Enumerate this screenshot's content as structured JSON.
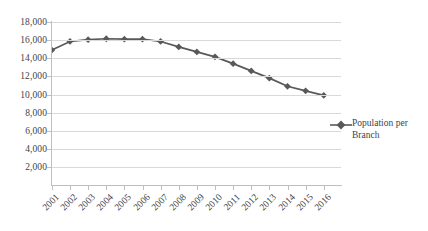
{
  "chart_data": {
    "type": "line",
    "title": "",
    "xlabel": "",
    "ylabel": "",
    "categories": [
      "2001",
      "2002",
      "2003",
      "2004",
      "2005",
      "2006",
      "2007",
      "2008",
      "2009",
      "2010",
      "2011",
      "2012",
      "2013",
      "2014",
      "2015",
      "2016"
    ],
    "series": [
      {
        "name": "Population per Branch",
        "color": "#595959",
        "marker": "diamond",
        "values": [
          14900,
          15850,
          16050,
          16150,
          16100,
          16100,
          15850,
          15250,
          14700,
          14150,
          13400,
          12600,
          11800,
          10900,
          10400,
          9900
        ]
      }
    ],
    "ylim": [
      0,
      18000
    ],
    "ytick_values": [
      2000,
      4000,
      6000,
      8000,
      10000,
      12000,
      14000,
      16000,
      18000
    ],
    "ytick_labels": [
      "2,000",
      "4,000",
      "6,000",
      "8,000",
      "10,000",
      "12,000",
      "14,000",
      "16,000",
      "18,000"
    ],
    "grid": true,
    "grid_axis": "y",
    "grid_color": "#d9d9d9",
    "axis_color": "#bfbfbf",
    "legend_position": "right",
    "legend_entries": [
      "Population per Branch"
    ]
  },
  "legend": {
    "entry_label": "Population per Branch"
  },
  "axes": {
    "y_labels": [
      "18,000",
      "16,000",
      "14,000",
      "12,000",
      "10,000",
      "8,000",
      "6,000",
      "4,000",
      "2,000"
    ],
    "x_labels": [
      "2001",
      "2002",
      "2003",
      "2004",
      "2005",
      "2006",
      "2007",
      "2008",
      "2009",
      "2010",
      "2011",
      "2012",
      "2013",
      "2014",
      "2015",
      "2016"
    ]
  }
}
